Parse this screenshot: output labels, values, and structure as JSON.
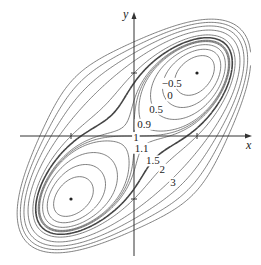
{
  "chart_data": {
    "type": "contour",
    "title": "",
    "function_hint": "f(x, y) = x^4 + y^4 - 4xy + 1",
    "xlabel": "x",
    "ylabel": "y",
    "xlim": [
      -2.1,
      1.85
    ],
    "ylim": [
      -1.9,
      2.0
    ],
    "x_ticks": [
      -1,
      1
    ],
    "y_ticks": [
      -1,
      1
    ],
    "levels": [
      -0.5,
      0,
      0.5,
      0.9,
      1,
      1.1,
      1.5,
      2,
      3,
      4,
      5,
      6
    ],
    "bold_levels": [
      1.5
    ],
    "labeled_levels": [
      {
        "text": "−0.5",
        "value": -0.5,
        "x": 0.6,
        "y": 0.78
      },
      {
        "text": "0",
        "value": 0,
        "x": 0.57,
        "y": 0.58
      },
      {
        "text": "0.5",
        "value": 0.5,
        "x": 0.35,
        "y": 0.37
      },
      {
        "text": "0.9",
        "value": 0.9,
        "x": 0.16,
        "y": 0.13
      },
      {
        "text": "1",
        "value": 1,
        "x": 0.03,
        "y": -0.08
      },
      {
        "text": "1.1",
        "value": 1.1,
        "x": 0.12,
        "y": -0.25
      },
      {
        "text": "1.5",
        "value": 1.5,
        "x": 0.3,
        "y": -0.45
      },
      {
        "text": "2",
        "value": 2,
        "x": 0.45,
        "y": -0.58
      },
      {
        "text": "3",
        "value": 3,
        "x": 0.62,
        "y": -0.8
      }
    ],
    "critical_points": [
      {
        "x": 1,
        "y": 1,
        "type": "minimum",
        "value": -1
      },
      {
        "x": -1,
        "y": -1,
        "type": "minimum",
        "value": -1
      },
      {
        "x": 0,
        "y": 0,
        "type": "saddle",
        "value": 1
      }
    ],
    "grid": false,
    "legend": null
  },
  "plot": {
    "width": 261,
    "height": 265,
    "origin_px": [
      134,
      136
    ],
    "unit_px": 63,
    "x_axis_range_px": [
      20,
      252
    ],
    "y_axis_range_px": [
      12,
      256
    ]
  },
  "axes": {
    "x_label": "x",
    "y_label": "y"
  }
}
